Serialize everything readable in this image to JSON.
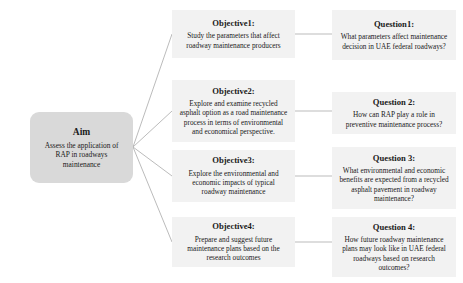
{
  "diagram": {
    "type": "research-framework-flowchart",
    "colors": {
      "aim_fill": "#d9d9d9",
      "node_fill": "#f2f2f2",
      "connector": "#b3b3b3",
      "text": "#1a1a1a"
    },
    "aim": {
      "title": "Aim",
      "body": "Assess the application of RAP in roadways maintenance"
    },
    "objectives": [
      {
        "title": "Objective1:",
        "body": "Study the parameters that affect roadway maintenance producers"
      },
      {
        "title": "Objective2:",
        "body": "Explore and examine recycled asphalt option as a road maintenance process in terms of environmental and economical perspective."
      },
      {
        "title": "Objective3:",
        "body": "Explore the environmental and economic impacts of typical roadway maintenance"
      },
      {
        "title": "Objective4:",
        "body": "Prepare and suggest future maintenance plans based on the research outcomes"
      }
    ],
    "questions": [
      {
        "title": "Question1:",
        "body": "What parameters affect maintenance decision in UAE federal roadways?"
      },
      {
        "title": "Question 2:",
        "body": "How can RAP play a role in preventive maintenance process?"
      },
      {
        "title": "Question 3:",
        "body": "What environmental and economic benefits are expected from a recycled asphalt pavement in roadway maintenance?"
      },
      {
        "title": "Question 4:",
        "body": "How future roadway maintenance plans may look like in UAE federal roadways based on research outcomes?"
      }
    ]
  }
}
